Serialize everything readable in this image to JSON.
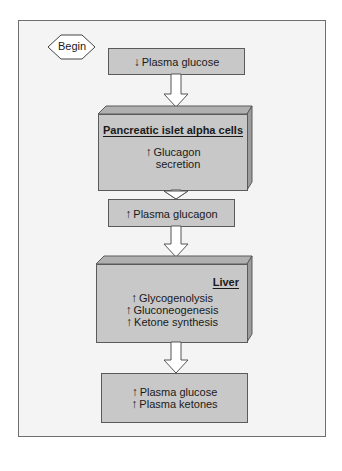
{
  "diagram": {
    "start": {
      "label": "Begin"
    },
    "steps": [
      {
        "id": "step1",
        "lines": [
          {
            "arrow": "↓",
            "text": "Plasma glucose"
          }
        ]
      },
      {
        "id": "step2",
        "title": "Pancreatic islet alpha cells",
        "lines": [
          {
            "arrow": "↑",
            "text": "Glucagon"
          },
          {
            "arrow": "",
            "text": "secretion"
          }
        ]
      },
      {
        "id": "step3",
        "lines": [
          {
            "arrow": "↑",
            "text": "Plasma glucagon"
          }
        ]
      },
      {
        "id": "step4",
        "title": "Liver",
        "lines": [
          {
            "arrow": "↑",
            "text": "Glycogenolysis"
          },
          {
            "arrow": "↑",
            "text": "Gluconeogenesis"
          },
          {
            "arrow": "↑",
            "text": "Ketone synthesis"
          }
        ]
      },
      {
        "id": "step5",
        "lines": [
          {
            "arrow": "↑",
            "text": "Plasma glucose"
          },
          {
            "arrow": "↑",
            "text": "Plasma ketones"
          }
        ]
      }
    ],
    "colors": {
      "box_fill": "#c8c8c8",
      "box_side": "#9c9c9c",
      "box_top": "#b0b0b0",
      "frame_bg": "#f4f4f4",
      "border": "#5a5a5a"
    }
  }
}
